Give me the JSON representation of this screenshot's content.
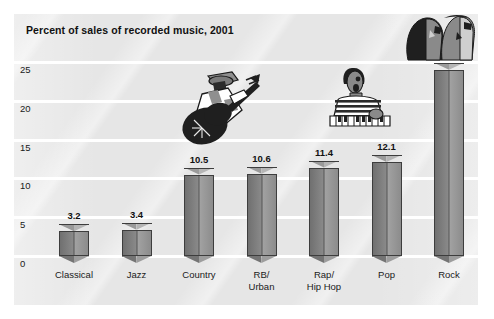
{
  "chart_data": {
    "type": "bar",
    "title": "Percent of sales of recorded music, 2001",
    "xlabel": "",
    "ylabel": "",
    "ylim": [
      0,
      25
    ],
    "yticks": [
      0,
      5,
      10,
      15,
      20,
      25
    ],
    "ytick_labels": [
      "0",
      "5",
      "10",
      "15",
      "20",
      "25"
    ],
    "grid": true,
    "legend": "none",
    "categories": [
      "Classical",
      "Jazz",
      "Country",
      "RB/\nUrban",
      "Rap/\nHip Hop",
      "Pop",
      "Rock"
    ],
    "values": [
      3.2,
      3.4,
      10.5,
      10.6,
      11.4,
      12.1,
      24.0
    ],
    "value_labels": [
      "3.2",
      "3.4",
      "10.5",
      "10.6",
      "11.4",
      "12.1",
      "24.0"
    ],
    "bars": [
      {
        "category": "Classical",
        "label_lines": [
          "Classical"
        ],
        "value": 3.2,
        "value_label": "3.2"
      },
      {
        "category": "Jazz",
        "label_lines": [
          "Jazz"
        ],
        "value": 3.4,
        "value_label": "3.4"
      },
      {
        "category": "Country",
        "label_lines": [
          "Country"
        ],
        "value": 10.5,
        "value_label": "10.5"
      },
      {
        "category": "RB/Urban",
        "label_lines": [
          "RB/",
          "Urban"
        ],
        "value": 10.6,
        "value_label": "10.6"
      },
      {
        "category": "Rap/Hip Hop",
        "label_lines": [
          "Rap/",
          "Hip Hop"
        ],
        "value": 11.4,
        "value_label": "11.4"
      },
      {
        "category": "Pop",
        "label_lines": [
          "Pop"
        ],
        "value": 12.1,
        "value_label": "12.1"
      },
      {
        "category": "Rock",
        "label_lines": [
          "Rock"
        ],
        "value": 24.0,
        "value_label": "24.0"
      }
    ]
  },
  "axis": {
    "y_ticks": [
      {
        "label": "25",
        "value": 25
      },
      {
        "label": "20",
        "value": 20
      },
      {
        "label": "15",
        "value": 15
      },
      {
        "label": "10",
        "value": 10
      },
      {
        "label": "5",
        "value": 5
      },
      {
        "label": "0",
        "value": 0
      }
    ]
  },
  "category_labels": [
    "Classical",
    "Jazz",
    "Country",
    "RB/\nUrban",
    "Rap/\nHip Hop",
    "Pop",
    "Rock"
  ],
  "decorations": [
    {
      "name": "guitarist-illustration",
      "description": "Guitar player wearing a hat"
    },
    {
      "name": "singer-illustration",
      "description": "Singer in striped shirt at a keyboard"
    },
    {
      "name": "duo-faces-illustration",
      "description": "Two overlapping face profiles"
    }
  ],
  "colors": {
    "panel_background": "#e6e6e6",
    "gridline": "#ffffff",
    "bar_left_face": "#7d7d7d",
    "bar_right_face": "#a0a0a0",
    "bar_outline": "#3d3d3d",
    "text": "#111111",
    "page_background": "#ffffff"
  }
}
